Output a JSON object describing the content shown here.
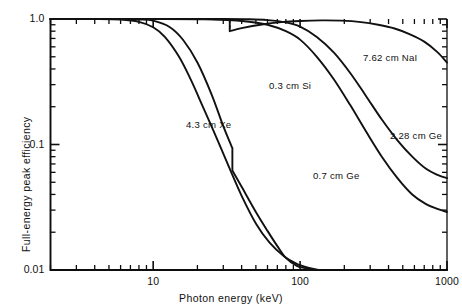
{
  "chart_data": {
    "type": "line",
    "title": "",
    "xlabel": "Photon energy (keV)",
    "ylabel": "Full-energy peak efficiency",
    "xscale": "log",
    "yscale": "log",
    "xlim": [
      2,
      1000
    ],
    "ylim": [
      0.01,
      1.0
    ],
    "grid": false,
    "legend_position": "inline-annotations",
    "xticklabels": [
      "10",
      "100",
      "1000"
    ],
    "xtickvalues": [
      10,
      100,
      1000
    ],
    "yticklabels": [
      "1.0",
      "0.1",
      "0.01"
    ],
    "ytickvalues": [
      1.0,
      0.1,
      0.01
    ],
    "series": [
      {
        "name": "4.3 cm Xe",
        "label": "4.3 cm Xe",
        "x": [
          2,
          4,
          6,
          8,
          10,
          13,
          16,
          20,
          25,
          30,
          34,
          34.6,
          34.6,
          40,
          50,
          60,
          70,
          80,
          95,
          110,
          125
        ],
        "y": [
          1.0,
          1.0,
          1.0,
          0.99,
          0.97,
          0.86,
          0.68,
          0.45,
          0.25,
          0.14,
          0.098,
          0.094,
          0.062,
          0.046,
          0.029,
          0.0205,
          0.0155,
          0.0125,
          0.0108,
          0.0103,
          0.01
        ]
      },
      {
        "name": "0.3 cm Si",
        "label": "0.3 cm Si",
        "x": [
          2,
          4,
          6,
          8,
          10,
          12,
          15,
          18,
          22,
          27,
          33,
          40,
          50,
          62,
          78,
          95,
          115,
          135
        ],
        "y": [
          1.0,
          1.0,
          0.99,
          0.95,
          0.86,
          0.72,
          0.5,
          0.33,
          0.195,
          0.113,
          0.065,
          0.039,
          0.0235,
          0.0165,
          0.0128,
          0.0112,
          0.0104,
          0.01
        ]
      },
      {
        "name": "7.62 cm NaI",
        "label": "7.62 cm NaI",
        "x": [
          2,
          5,
          10,
          18,
          25,
          30,
          33,
          33.2,
          33.2,
          40,
          55,
          75,
          100,
          140,
          190,
          260,
          340,
          440,
          560,
          700,
          860,
          1000
        ],
        "y": [
          1.0,
          1.0,
          1.0,
          1.0,
          1.0,
          0.99,
          0.985,
          0.98,
          0.8,
          0.845,
          0.905,
          0.945,
          0.965,
          0.975,
          0.97,
          0.945,
          0.9,
          0.84,
          0.755,
          0.66,
          0.545,
          0.45
        ]
      },
      {
        "name": "2.28 cm Ge",
        "label": "2.28 cm Ge",
        "x": [
          2,
          6,
          12,
          20,
          30,
          45,
          60,
          80,
          100,
          130,
          170,
          220,
          280,
          360,
          460,
          580,
          720,
          870,
          1000
        ],
        "y": [
          1.0,
          1.0,
          1.0,
          1.0,
          1.0,
          0.995,
          0.98,
          0.94,
          0.87,
          0.72,
          0.54,
          0.37,
          0.245,
          0.158,
          0.108,
          0.08,
          0.064,
          0.057,
          0.054
        ]
      },
      {
        "name": "0.7 cm Ge",
        "label": "0.7 cm Ge",
        "x": [
          2,
          6,
          12,
          20,
          30,
          45,
          60,
          80,
          100,
          130,
          170,
          220,
          280,
          360,
          460,
          580,
          720,
          870,
          1000
        ],
        "y": [
          1.0,
          1.0,
          1.0,
          0.995,
          0.985,
          0.95,
          0.9,
          0.8,
          0.685,
          0.5,
          0.33,
          0.205,
          0.128,
          0.08,
          0.054,
          0.04,
          0.0335,
          0.0305,
          0.029
        ]
      }
    ],
    "annotations": [
      {
        "text": "7.62 cm NaI",
        "x_px": 363,
        "y_px": 52
      },
      {
        "text": "0.3 cm Si",
        "x_px": 269,
        "y_px": 80
      },
      {
        "text": "4.3 cm Xe",
        "x_px": 186,
        "y_px": 119
      },
      {
        "text": "2.28 cm Ge",
        "x_px": 390,
        "y_px": 130
      },
      {
        "text": "0.7 cm Ge",
        "x_px": 313,
        "y_px": 170
      }
    ]
  },
  "axes": {
    "x_title": "Photon energy (keV)",
    "y_title": "Full-energy peak efficiency",
    "x_labels": [
      "10",
      "100",
      "1000"
    ],
    "y_labels": [
      "1.0",
      "0.1",
      "0.01"
    ]
  },
  "colors": {
    "background": "#ffffff",
    "ink": "#111111",
    "axis": "#0d0d0d"
  }
}
